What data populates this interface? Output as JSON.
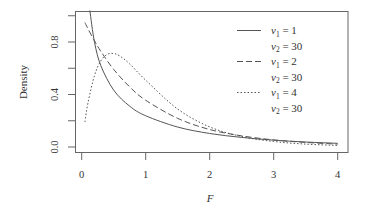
{
  "chart_data": {
    "type": "line",
    "title": "",
    "xlabel": "F",
    "ylabel": "Density",
    "xlim": [
      0,
      4
    ],
    "ylim": [
      0,
      1.0
    ],
    "x_ticks": [
      "0",
      "1",
      "2",
      "3",
      "4"
    ],
    "y_ticks": [
      "0.0",
      "0.4",
      "0.8"
    ],
    "grid": false,
    "legend_position": "top-right (inside)",
    "series": [
      {
        "name": "v1 = 1, v2 = 30",
        "line_style": "solid",
        "x": [
          0.127,
          0.2,
          0.3,
          0.5,
          0.75,
          1.0,
          1.5,
          2.0,
          2.5,
          3.0,
          3.5,
          4.0
        ],
        "values": [
          1.04,
          0.798,
          0.619,
          0.433,
          0.311,
          0.238,
          0.152,
          0.103,
          0.073,
          0.052,
          0.038,
          0.028
        ]
      },
      {
        "name": "v1 = 2, v2 = 30",
        "line_style": "dashed",
        "x": [
          0.05,
          0.1,
          0.2,
          0.3,
          0.5,
          0.75,
          1.0,
          1.5,
          2.0,
          2.5,
          3.0,
          3.5,
          4.0
        ],
        "values": [
          0.948,
          0.899,
          0.809,
          0.728,
          0.591,
          0.458,
          0.356,
          0.218,
          0.133,
          0.085,
          0.054,
          0.035,
          0.022
        ]
      },
      {
        "name": "v1 = 4, v2 = 30",
        "line_style": "dotted",
        "x": [
          0.05,
          0.1,
          0.2,
          0.3,
          0.4,
          0.5,
          0.6,
          0.75,
          1.0,
          1.5,
          2.0,
          2.5,
          3.0,
          3.5,
          4.0
        ],
        "values": [
          0.191,
          0.341,
          0.545,
          0.657,
          0.706,
          0.712,
          0.692,
          0.633,
          0.509,
          0.289,
          0.153,
          0.08,
          0.042,
          0.022,
          0.012
        ]
      }
    ]
  },
  "legend": [
    {
      "line1_sym": "v",
      "line1_sub": "1",
      "line1_val": " = 1",
      "line2_sym": "v",
      "line2_sub": "2",
      "line2_val": " = 30",
      "style": "solid"
    },
    {
      "line1_sym": "v",
      "line1_sub": "1",
      "line1_val": " = 2",
      "line2_sym": "v",
      "line2_sub": "2",
      "line2_val": " = 30",
      "style": "dashed"
    },
    {
      "line1_sym": "v",
      "line1_sub": "1",
      "line1_val": " = 4",
      "line2_sym": "v",
      "line2_sub": "2",
      "line2_val": " = 30",
      "style": "dotted"
    }
  ],
  "colors": {
    "frame": "#555555",
    "line": "#555555",
    "text": "#333333"
  }
}
